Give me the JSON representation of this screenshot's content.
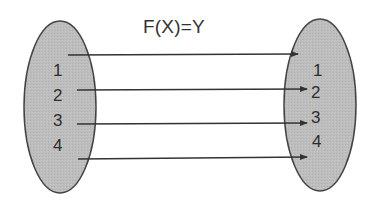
{
  "diagram": {
    "title": "F(X)=Y",
    "domain_set": {
      "items": [
        "1",
        "2",
        "3",
        "4"
      ],
      "fill": "#bdbdbd",
      "stroke": "#444444"
    },
    "codomain_set": {
      "items": [
        "1",
        "2",
        "3",
        "4"
      ],
      "fill": "#bdbdbd",
      "stroke": "#444444"
    },
    "arrows": [
      {
        "from_y": 55,
        "to_y": 55
      },
      {
        "from_y": 89,
        "to_y": 89
      },
      {
        "from_y": 124,
        "to_y": 124
      },
      {
        "from_y": 158,
        "to_y": 158
      }
    ],
    "arrow_color": "#333333"
  }
}
